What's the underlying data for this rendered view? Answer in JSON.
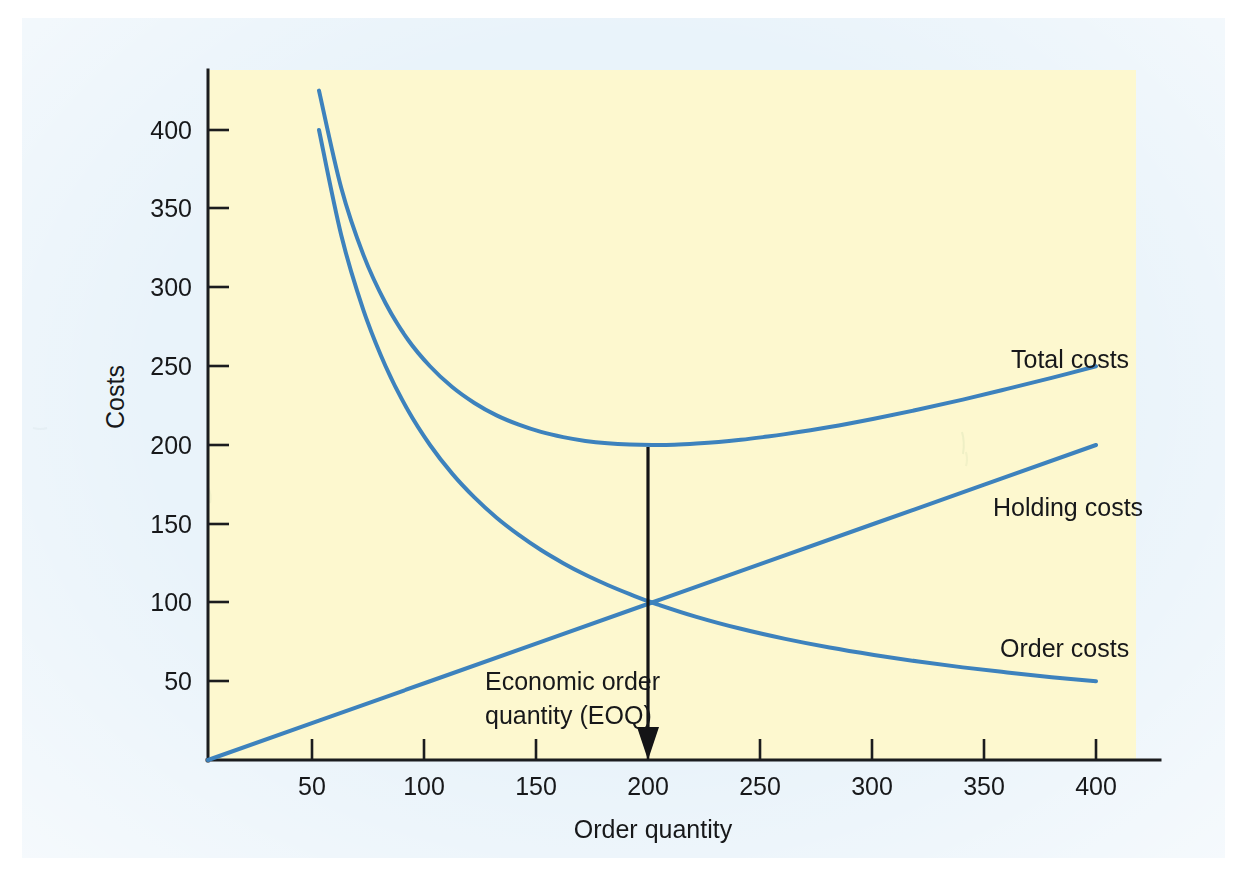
{
  "figure": {
    "page_background": "#e9f3fa",
    "plot_background": "#fdf8cf",
    "axis_color": "#1b1c1e",
    "curve_color": "#3d82bd",
    "annotation_color": "#141416"
  },
  "chart_data": {
    "type": "line",
    "title": "",
    "subtitle": "",
    "xlabel": "Order quantity",
    "ylabel": "Costs",
    "xlim": [
      0,
      425
    ],
    "ylim": [
      0,
      430
    ],
    "xticks": [
      50,
      100,
      150,
      200,
      250,
      300,
      350,
      400
    ],
    "yticks": [
      50,
      100,
      150,
      200,
      250,
      300,
      350,
      400
    ],
    "xtick_labels": [
      "50",
      "100",
      "150",
      "200",
      "250",
      "300",
      "350",
      "400"
    ],
    "ytick_labels": [
      "50",
      "100",
      "150",
      "200",
      "250",
      "300",
      "350",
      "400"
    ],
    "grid": false,
    "legend": "inline-labels-at-right-end-of-curves",
    "series": [
      {
        "name": "Total costs",
        "label": "Total costs",
        "color": "#3d82bd",
        "formula": "holding + order = Q/2 + 20000/Q",
        "x": [
          50,
          60,
          70,
          80,
          90,
          100,
          110,
          120,
          130,
          140,
          150,
          160,
          170,
          180,
          190,
          200,
          210,
          220,
          230,
          240,
          250,
          260,
          280,
          300,
          320,
          340,
          360,
          380,
          400
        ],
        "y": [
          425,
          363.3,
          320.7,
          290,
          267,
          250,
          236.8,
          226.7,
          218.8,
          212.9,
          208.3,
          205,
          202.6,
          201.1,
          200.3,
          200,
          200.2,
          200.9,
          201.9,
          203.3,
          205,
          206.9,
          211.4,
          216.7,
          222.5,
          228.8,
          235.6,
          242.6,
          250
        ]
      },
      {
        "name": "Holding costs",
        "label": "Holding costs",
        "color": "#3d82bd",
        "formula": "Q/2",
        "x": [
          0,
          50,
          100,
          150,
          200,
          250,
          300,
          350,
          400
        ],
        "y": [
          0,
          25,
          50,
          75,
          100,
          125,
          150,
          175,
          200
        ]
      },
      {
        "name": "Order costs",
        "label": "Order costs",
        "color": "#3d82bd",
        "formula": "20000/Q",
        "x": [
          50,
          60,
          70,
          80,
          90,
          100,
          110,
          120,
          130,
          140,
          150,
          160,
          170,
          180,
          190,
          200,
          220,
          240,
          260,
          280,
          300,
          320,
          340,
          360,
          380,
          400
        ],
        "y": [
          400,
          333.3,
          285.7,
          250,
          222.2,
          200,
          181.8,
          166.7,
          153.8,
          142.9,
          133.3,
          125,
          117.6,
          111.1,
          105.3,
          100,
          90.9,
          83.3,
          76.9,
          71.4,
          66.7,
          62.5,
          58.8,
          55.6,
          52.6,
          50
        ]
      }
    ],
    "annotations": [
      {
        "name": "eoq-arrow",
        "text_line1": "Economic order",
        "text_line2": "quantity (EOQ)",
        "x": 200,
        "y_from": 200,
        "y_to": 0,
        "description": "Vertical arrow from the minimum of the total cost curve down to the order-quantity axis at 200"
      }
    ],
    "key_points": {
      "eoq_quantity": 200,
      "minimum_total_cost": 200,
      "intersection_holding_order": {
        "x": 200,
        "y": 100
      }
    }
  },
  "labels": {
    "y_axis_title": "Costs",
    "x_axis_title": "Order quantity",
    "total_costs": "Total costs",
    "holding_costs": "Holding costs",
    "order_costs": "Order costs",
    "eoq_line1": "Economic order",
    "eoq_line2": "quantity (EOQ)",
    "ytick_400": "400",
    "ytick_350": "350",
    "ytick_300": "300",
    "ytick_250": "250",
    "ytick_200": "200",
    "ytick_150": "150",
    "ytick_100": "100",
    "ytick_50": "50",
    "xtick_50": "50",
    "xtick_100": "100",
    "xtick_150": "150",
    "xtick_200": "200",
    "xtick_250": "250",
    "xtick_300": "300",
    "xtick_350": "350",
    "xtick_400": "400"
  }
}
